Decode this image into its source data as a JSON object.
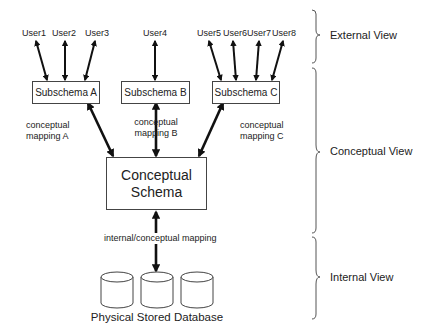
{
  "users": [
    {
      "label": "User1",
      "x": 34
    },
    {
      "label": "User2",
      "x": 64
    },
    {
      "label": "User3",
      "x": 97
    },
    {
      "label": "User4",
      "x": 155
    },
    {
      "label": "User5",
      "x": 220
    },
    {
      "label": "User6",
      "x": 250
    },
    {
      "label": "User7",
      "x": 283
    },
    {
      "label": "User8",
      "x": 310
    }
  ],
  "subschemas": [
    {
      "label": "Subschema A"
    },
    {
      "label": "Subschema B"
    },
    {
      "label": "Subschema C"
    }
  ],
  "mappings": [
    {
      "line1": "conceptual",
      "line2": "mapping A"
    },
    {
      "line1": "conceptual",
      "line2": "mapping B"
    },
    {
      "line1": "conceptual",
      "line2": "mapping C"
    }
  ],
  "conceptual_schema": {
    "line1": "Conceptual",
    "line2": "Schema"
  },
  "internal_mapping": "internal/conceptual mapping",
  "database_label": "Physical Stored Database",
  "views": {
    "external": "External View",
    "conceptual": "Conceptual View",
    "internal": "Internal View"
  }
}
